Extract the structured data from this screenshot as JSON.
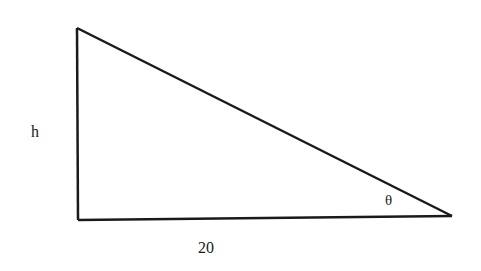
{
  "diagram": {
    "type": "right-triangle",
    "labels": {
      "height": "h",
      "base": "20",
      "angle": "θ"
    },
    "vertices": {
      "top_left": [
        77,
        28
      ],
      "bottom_left": [
        78,
        220
      ],
      "bottom_right": [
        452,
        216
      ]
    },
    "stroke_color": "#1a1a1a",
    "background_color": "#ffffff"
  }
}
